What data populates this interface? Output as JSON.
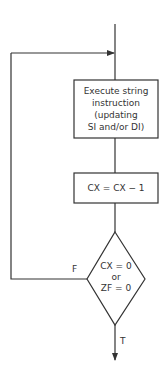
{
  "diagram": {
    "type": "flowchart",
    "nodes": [
      {
        "id": "execute",
        "shape": "rectangle",
        "lines": [
          "Execute string",
          "instruction",
          "(updating",
          "SI and/or DI)"
        ]
      },
      {
        "id": "decrement",
        "shape": "rectangle",
        "lines": [
          "CX = CX − 1"
        ]
      },
      {
        "id": "test",
        "shape": "diamond",
        "lines": [
          "CX = 0",
          "or",
          "ZF = 0"
        ]
      }
    ],
    "edges": [
      {
        "from": "entry",
        "to": "execute",
        "label": ""
      },
      {
        "from": "execute",
        "to": "decrement",
        "label": ""
      },
      {
        "from": "decrement",
        "to": "test",
        "label": ""
      },
      {
        "from": "test",
        "to": "execute",
        "label": "F"
      },
      {
        "from": "test",
        "to": "exit",
        "label": "T"
      }
    ],
    "labels": {
      "false": "F",
      "true": "T"
    },
    "colors": {
      "stroke": "#333333",
      "background": "#ffffff"
    }
  }
}
